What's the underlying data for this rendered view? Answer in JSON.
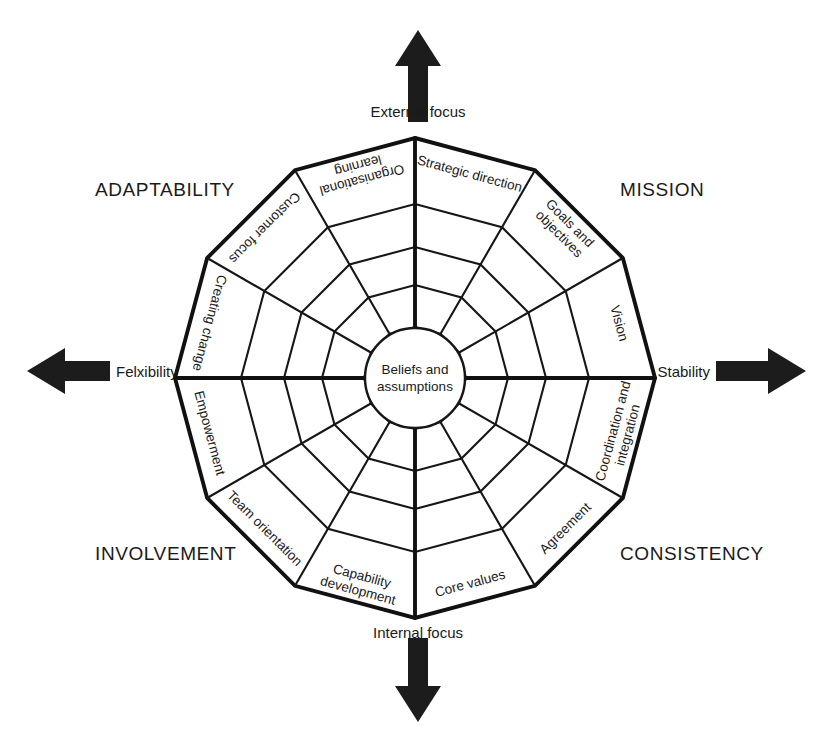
{
  "figure": {
    "center_hub": {
      "line1": "Beliefs and",
      "line2": "assumptions"
    }
  },
  "axes": {
    "top": {
      "label": "External focus",
      "arrow": "arrow-up-icon"
    },
    "bottom": {
      "label": "Internal focus",
      "arrow": "arrow-down-icon"
    },
    "left": {
      "label": "Felxibility",
      "arrow": "arrow-left-icon"
    },
    "right": {
      "label": "Stability",
      "arrow": "arrow-right-icon"
    }
  },
  "quadrants": [
    {
      "key": "adaptability",
      "label": "ADAPTABILITY",
      "x": 95,
      "y": 196
    },
    {
      "key": "mission",
      "label": "MISSION",
      "x": 620,
      "y": 196
    },
    {
      "key": "involvement",
      "label": "INVOLVEMENT",
      "x": 95,
      "y": 560
    },
    {
      "key": "consistency",
      "label": "CONSISTENCY",
      "x": 620,
      "y": 560
    }
  ],
  "traits": [
    {
      "index": 0,
      "lines": [
        "Strategic direction"
      ],
      "quadrant": "mission"
    },
    {
      "index": 1,
      "lines": [
        "Goals and",
        "objectives"
      ],
      "quadrant": "mission"
    },
    {
      "index": 2,
      "lines": [
        "Vision"
      ],
      "quadrant": "mission"
    },
    {
      "index": 3,
      "lines": [
        "Coordination and",
        "integration"
      ],
      "quadrant": "consistency"
    },
    {
      "index": 4,
      "lines": [
        "Agreement"
      ],
      "quadrant": "consistency"
    },
    {
      "index": 5,
      "lines": [
        "Core values"
      ],
      "quadrant": "consistency"
    },
    {
      "index": 6,
      "lines": [
        "Capability",
        "development"
      ],
      "quadrant": "involvement"
    },
    {
      "index": 7,
      "lines": [
        "Team orientation"
      ],
      "quadrant": "involvement"
    },
    {
      "index": 8,
      "lines": [
        "Empowerment"
      ],
      "quadrant": "involvement"
    },
    {
      "index": 9,
      "lines": [
        "Creating change"
      ],
      "quadrant": "adaptability"
    },
    {
      "index": 10,
      "lines": [
        "Customer focus"
      ],
      "quadrant": "adaptability"
    },
    {
      "index": 11,
      "lines": [
        "Organisational",
        "learning"
      ],
      "quadrant": "adaptability"
    }
  ],
  "chart_data": {
    "type": "radar",
    "sectors": 12,
    "rings": 5,
    "center": {
      "x": 415,
      "y": 378
    },
    "ring_radii": [
      50,
      93,
      131,
      174,
      240
    ],
    "bold_rings": [
      4,
      0
    ],
    "bold_radials": [
      0,
      3,
      6,
      9
    ],
    "categories": [
      "Strategic direction",
      "Goals and objectives",
      "Vision",
      "Coordination and integration",
      "Agreement",
      "Core values",
      "Capability development",
      "Team orientation",
      "Empowerment",
      "Creating change",
      "Customer focus",
      "Organisational learning"
    ],
    "groups": [
      {
        "name": "MISSION",
        "categories": [
          "Strategic direction",
          "Goals and objectives",
          "Vision"
        ]
      },
      {
        "name": "CONSISTENCY",
        "categories": [
          "Coordination and integration",
          "Agreement",
          "Core values"
        ]
      },
      {
        "name": "INVOLVEMENT",
        "categories": [
          "Capability development",
          "Team orientation",
          "Empowerment"
        ]
      },
      {
        "name": "ADAPTABILITY",
        "categories": [
          "Creating change",
          "Customer focus",
          "Organisational learning"
        ]
      }
    ],
    "axis_poles": {
      "vertical": {
        "positive": "External focus",
        "negative": "Internal focus"
      },
      "horizontal": {
        "negative": "Felxibility",
        "positive": "Stability"
      }
    },
    "center_label": "Beliefs and assumptions",
    "grid": true,
    "legend": "none",
    "colors": {
      "stroke": "#161616",
      "fill": "#ffffff",
      "text": "#1a1a1a"
    }
  },
  "colors": {
    "background": "#ffffff",
    "line": "#161616",
    "text": "#1a1a1a",
    "arrow": "#1c1c1c"
  }
}
